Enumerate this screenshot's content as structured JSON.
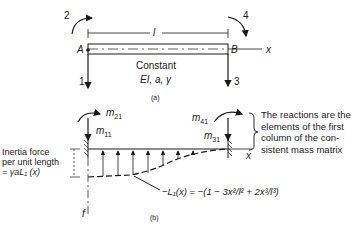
{
  "part_a": {
    "caption": "(a)",
    "node_left": "A",
    "node_right": "B",
    "axis": "x",
    "length": "l",
    "dof": [
      "1",
      "2",
      "3",
      "4"
    ],
    "props_line1": "Constant",
    "props_line2": "EI, a, γ"
  },
  "part_b": {
    "caption": "(b)",
    "m11": "m",
    "m11_sub": "11",
    "m21": "m",
    "m21_sub": "21",
    "m31": "m",
    "m31_sub": "31",
    "m41": "m",
    "m41_sub": "41",
    "axis_x": "x",
    "axis_f": "f",
    "inertia_line1": "Inertia force",
    "inertia_line2": "per unit length",
    "inertia_line3": "= γaL₁ (x)",
    "formula": "−L₁(x) = −(1 − 3x²/l² + 2x³/l³)",
    "note_lines": [
      "The reactions are the",
      "elements of the first",
      "column of the con-",
      "sistent mass matrix"
    ]
  }
}
